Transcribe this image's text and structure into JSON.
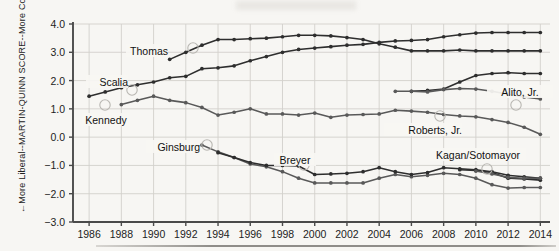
{
  "axes": {
    "y_title_main": "MARTIN-QUINN SCORE",
    "y_title_upper": "More Conservative",
    "y_title_lower": "More Liberal",
    "y_arrow_up": "→",
    "y_arrow_down": "←",
    "y_ticks": [
      "4.0",
      "3.0",
      "2.0",
      "1.0",
      "0.0",
      "−1.0",
      "−2.0",
      "−3.0"
    ],
    "y_tick_values": [
      4,
      3,
      2,
      1,
      0,
      -1,
      -2,
      -3
    ],
    "y_min": -3.0,
    "y_max": 4.0,
    "x_ticks": [
      "1986",
      "1988",
      "1990",
      "1992",
      "1994",
      "1996",
      "1998",
      "2000",
      "2002",
      "2004",
      "2006",
      "2008",
      "2010",
      "2012",
      "2014"
    ],
    "x_tick_values": [
      1986,
      1988,
      1990,
      1992,
      1994,
      1996,
      1998,
      2000,
      2002,
      2004,
      2006,
      2008,
      2010,
      2012,
      2014
    ],
    "x_min": 1985,
    "x_max": 2014.6
  },
  "annotations": [
    {
      "name": "thomas",
      "text": "Thomas",
      "x": 168,
      "y": 51,
      "anchor": "end",
      "marker_x": 193,
      "marker_y": 48
    },
    {
      "name": "scalia",
      "text": "Scalia",
      "x": 128,
      "y": 82,
      "anchor": "end",
      "marker_x": 132,
      "marker_y": 90
    },
    {
      "name": "kennedy",
      "text": "Kennedy",
      "x": 106,
      "y": 120,
      "anchor": "middle",
      "marker_x": 105,
      "marker_y": 105
    },
    {
      "name": "ginsburg",
      "text": "Ginsburg",
      "x": 200,
      "y": 147,
      "anchor": "end",
      "marker_x": 207,
      "marker_y": 145
    },
    {
      "name": "breyer",
      "text": "Breyer",
      "x": 295,
      "y": 160,
      "anchor": "middle",
      "marker_x": 304,
      "marker_y": 165
    },
    {
      "name": "roberts",
      "text": "Roberts, Jr.",
      "x": 462,
      "y": 130,
      "anchor": "end",
      "marker_x": 440,
      "marker_y": 116
    },
    {
      "name": "alito",
      "text": "Alito, Jr.",
      "x": 520,
      "y": 92,
      "anchor": "middle",
      "marker_x": 516,
      "marker_y": 105
    },
    {
      "name": "kagan",
      "text": "Kagan/Sotomayor",
      "x": 478,
      "y": 155,
      "anchor": "middle",
      "marker_x": 487,
      "marker_y": 169
    }
  ],
  "colors": {
    "dark": "#2e2e2e",
    "mid": "#595959",
    "grid": "#d2d0cc",
    "axis": "#4a4a4a",
    "background": "#f7f6f3"
  },
  "chart_data": {
    "type": "line",
    "title": "",
    "xlabel": "",
    "ylabel": "MARTIN-QUINN SCORE",
    "xlim": [
      1985,
      2014.6
    ],
    "ylim": [
      -3.0,
      4.0
    ],
    "grid": true,
    "legend": "inline-annotations",
    "series": [
      {
        "name": "Thomas",
        "tone": "dark",
        "x": [
          1991,
          1992,
          1993,
          1994,
          1995,
          1996,
          1997,
          1998,
          1999,
          2000,
          2001,
          2002,
          2003,
          2004,
          2005,
          2006,
          2007,
          2008,
          2009,
          2010,
          2011,
          2012,
          2013,
          2014
        ],
        "values": [
          2.75,
          3.0,
          3.25,
          3.45,
          3.45,
          3.48,
          3.5,
          3.55,
          3.6,
          3.6,
          3.58,
          3.52,
          3.45,
          3.3,
          3.18,
          3.05,
          3.05,
          3.05,
          3.08,
          3.05,
          3.05,
          3.05,
          3.05,
          3.05
        ]
      },
      {
        "name": "Scalia",
        "tone": "dark",
        "x": [
          1986,
          1987,
          1988,
          1989,
          1990,
          1991,
          1992,
          1993,
          1994,
          1995,
          1996,
          1997,
          1998,
          1999,
          2000,
          2001,
          2002,
          2003,
          2004,
          2005,
          2006,
          2007,
          2008,
          2009,
          2010,
          2011,
          2012,
          2013,
          2014
        ],
        "values": [
          1.45,
          1.6,
          1.75,
          1.85,
          1.95,
          2.1,
          2.15,
          2.42,
          2.45,
          2.52,
          2.7,
          2.85,
          3.0,
          3.1,
          3.15,
          3.2,
          3.25,
          3.28,
          3.35,
          3.4,
          3.42,
          3.45,
          3.55,
          3.62,
          3.68,
          3.7,
          3.7,
          3.7,
          3.7
        ]
      },
      {
        "name": "Kennedy",
        "tone": "mid",
        "x": [
          1988,
          1989,
          1990,
          1991,
          1992,
          1993,
          1994,
          1995,
          1996,
          1997,
          1998,
          1999,
          2000,
          2001,
          2002,
          2003,
          2004,
          2005,
          2006,
          2007,
          2008,
          2009,
          2010,
          2011,
          2012,
          2013,
          2014
        ],
        "values": [
          1.15,
          1.3,
          1.45,
          1.3,
          1.22,
          1.05,
          0.78,
          0.88,
          1.0,
          0.82,
          0.82,
          0.78,
          0.85,
          0.7,
          0.78,
          0.8,
          0.82,
          0.95,
          0.92,
          0.88,
          0.8,
          0.75,
          0.72,
          0.62,
          0.52,
          0.35,
          0.1
        ]
      },
      {
        "name": "Alito, Jr.",
        "tone": "dark",
        "x": [
          2006,
          2007,
          2008,
          2009,
          2010,
          2011,
          2012,
          2013,
          2014
        ],
        "values": [
          1.62,
          1.65,
          1.7,
          1.95,
          2.18,
          2.25,
          2.28,
          2.25,
          2.25
        ]
      },
      {
        "name": "Roberts, Jr.",
        "tone": "mid",
        "x": [
          2005,
          2006,
          2007,
          2008,
          2009,
          2010,
          2011,
          2012,
          2013,
          2014
        ],
        "values": [
          1.62,
          1.62,
          1.6,
          1.68,
          1.72,
          1.7,
          1.62,
          1.52,
          1.42,
          1.35
        ]
      },
      {
        "name": "Ginsburg",
        "tone": "mid",
        "x": [
          1993,
          1994,
          1995,
          1996,
          1997,
          1998,
          1999,
          2000,
          2001,
          2002,
          2003,
          2004,
          2005,
          2006,
          2007,
          2008,
          2009,
          2010,
          2011,
          2012,
          2013,
          2014
        ],
        "values": [
          -0.28,
          -0.52,
          -0.72,
          -0.95,
          -1.05,
          -1.22,
          -1.45,
          -1.62,
          -1.62,
          -1.62,
          -1.62,
          -1.45,
          -1.32,
          -1.4,
          -1.35,
          -1.28,
          -1.32,
          -1.45,
          -1.68,
          -1.8,
          -1.78,
          -1.78
        ]
      },
      {
        "name": "Breyer",
        "tone": "dark",
        "x": [
          1994,
          1995,
          1996,
          1997,
          1998,
          1999,
          2000,
          2001,
          2002,
          2003,
          2004,
          2005,
          2006,
          2007,
          2008,
          2009,
          2010,
          2011,
          2012,
          2013,
          2014
        ],
        "values": [
          -0.55,
          -0.72,
          -0.9,
          -1.0,
          -1.0,
          -1.02,
          -1.32,
          -1.3,
          -1.28,
          -1.22,
          -1.08,
          -1.22,
          -1.32,
          -1.25,
          -1.08,
          -1.12,
          -1.15,
          -1.22,
          -1.35,
          -1.4,
          -1.45
        ]
      },
      {
        "name": "Sotomayor",
        "tone": "dark",
        "x": [
          2009,
          2010,
          2011,
          2012,
          2013,
          2014
        ],
        "values": [
          -1.15,
          -1.18,
          -1.25,
          -1.45,
          -1.48,
          -1.52
        ]
      },
      {
        "name": "Kagan",
        "tone": "mid",
        "x": [
          2010,
          2011,
          2012,
          2013,
          2014
        ],
        "values": [
          -1.2,
          -1.3,
          -1.42,
          -1.45,
          -1.45
        ]
      }
    ]
  }
}
